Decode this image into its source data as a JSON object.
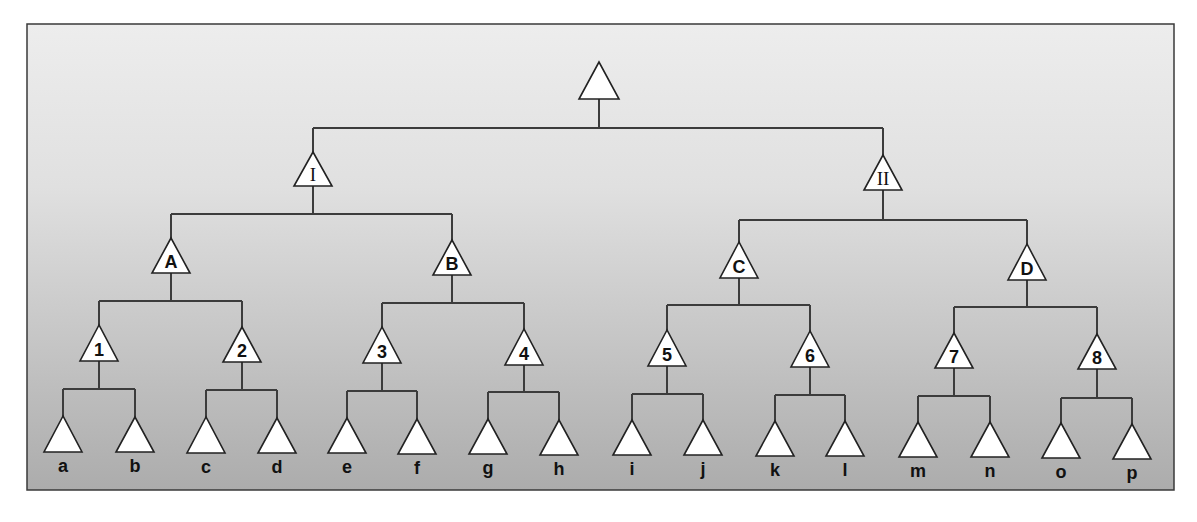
{
  "diagram": {
    "type": "tree-diagram",
    "colors": {
      "background_top": "#ededed",
      "background_bottom": "#acacac",
      "frame": "#3a3a3a",
      "lines": "#3c3c3c",
      "node_fill": "#ffffff"
    },
    "frame": {
      "x": 27,
      "y": 24,
      "w": 1147,
      "h": 466
    },
    "nodes": [
      {
        "id": "root",
        "label": "",
        "cx": 599,
        "apex": 62,
        "base": 99,
        "hw": 20,
        "style": "none",
        "children": [
          "I",
          "II"
        ],
        "bar_y": 128
      },
      {
        "id": "I",
        "label": "I",
        "cx": 313,
        "apex": 152,
        "base": 186,
        "hw": 19,
        "style": "serif",
        "children": [
          "A",
          "B"
        ],
        "bar_y": 214
      },
      {
        "id": "II",
        "label": "II",
        "cx": 883,
        "apex": 155,
        "base": 190,
        "hw": 19,
        "style": "serif",
        "children": [
          "C",
          "D"
        ],
        "bar_y": 220
      },
      {
        "id": "A",
        "label": "A",
        "cx": 171,
        "apex": 238,
        "base": 273,
        "hw": 19,
        "style": "sans",
        "children": [
          "1",
          "2"
        ],
        "bar_y": 301
      },
      {
        "id": "B",
        "label": "B",
        "cx": 452,
        "apex": 240,
        "base": 275,
        "hw": 19,
        "style": "sans",
        "children": [
          "3",
          "4"
        ],
        "bar_y": 303
      },
      {
        "id": "C",
        "label": "C",
        "cx": 739,
        "apex": 242,
        "base": 278,
        "hw": 19,
        "style": "sans",
        "children": [
          "5",
          "6"
        ],
        "bar_y": 305
      },
      {
        "id": "D",
        "label": "D",
        "cx": 1027,
        "apex": 244,
        "base": 280,
        "hw": 19,
        "style": "sans",
        "children": [
          "7",
          "8"
        ],
        "bar_y": 307
      },
      {
        "id": "1",
        "label": "1",
        "cx": 99,
        "apex": 325,
        "base": 361,
        "hw": 19,
        "style": "sans",
        "children": [
          "a",
          "b"
        ],
        "bar_y": 389
      },
      {
        "id": "2",
        "label": "2",
        "cx": 242,
        "apex": 327,
        "base": 362,
        "hw": 19,
        "style": "sans",
        "children": [
          "c",
          "d"
        ],
        "bar_y": 390
      },
      {
        "id": "3",
        "label": "3",
        "cx": 382,
        "apex": 327,
        "base": 363,
        "hw": 19,
        "style": "sans",
        "children": [
          "e",
          "f"
        ],
        "bar_y": 391
      },
      {
        "id": "4",
        "label": "4",
        "cx": 524,
        "apex": 329,
        "base": 365,
        "hw": 19,
        "style": "sans",
        "children": [
          "g",
          "h"
        ],
        "bar_y": 392
      },
      {
        "id": "5",
        "label": "5",
        "cx": 667,
        "apex": 330,
        "base": 366,
        "hw": 19,
        "style": "sans",
        "children": [
          "i",
          "j"
        ],
        "bar_y": 394
      },
      {
        "id": "6",
        "label": "6",
        "cx": 810,
        "apex": 331,
        "base": 367,
        "hw": 19,
        "style": "sans",
        "children": [
          "k",
          "l"
        ],
        "bar_y": 395
      },
      {
        "id": "7",
        "label": "7",
        "cx": 954,
        "apex": 333,
        "base": 368,
        "hw": 19,
        "style": "sans",
        "children": [
          "m",
          "n"
        ],
        "bar_y": 396
      },
      {
        "id": "8",
        "label": "8",
        "cx": 1097,
        "apex": 334,
        "base": 369,
        "hw": 19,
        "style": "sans",
        "children": [
          "o",
          "p"
        ],
        "bar_y": 398
      },
      {
        "id": "a",
        "label": "a",
        "cx": 63,
        "apex": 416,
        "base": 452,
        "hw": 19,
        "style": "leaf"
      },
      {
        "id": "b",
        "label": "b",
        "cx": 135,
        "apex": 417,
        "base": 452,
        "hw": 19,
        "style": "leaf"
      },
      {
        "id": "c",
        "label": "c",
        "cx": 206,
        "apex": 417,
        "base": 453,
        "hw": 19,
        "style": "leaf"
      },
      {
        "id": "d",
        "label": "d",
        "cx": 277,
        "apex": 418,
        "base": 453,
        "hw": 19,
        "style": "leaf"
      },
      {
        "id": "e",
        "label": "e",
        "cx": 347,
        "apex": 418,
        "base": 453,
        "hw": 19,
        "style": "leaf"
      },
      {
        "id": "f",
        "label": "f",
        "cx": 417,
        "apex": 419,
        "base": 454,
        "hw": 19,
        "style": "leaf"
      },
      {
        "id": "g",
        "label": "g",
        "cx": 488,
        "apex": 419,
        "base": 454,
        "hw": 19,
        "style": "leaf"
      },
      {
        "id": "h",
        "label": "h",
        "cx": 559,
        "apex": 420,
        "base": 455,
        "hw": 19,
        "style": "leaf"
      },
      {
        "id": "i",
        "label": "i",
        "cx": 632,
        "apex": 420,
        "base": 455,
        "hw": 19,
        "style": "leaf"
      },
      {
        "id": "j",
        "label": "j",
        "cx": 703,
        "apex": 420,
        "base": 455,
        "hw": 19,
        "style": "leaf"
      },
      {
        "id": "k",
        "label": "k",
        "cx": 775,
        "apex": 421,
        "base": 456,
        "hw": 19,
        "style": "leaf"
      },
      {
        "id": "l",
        "label": "l",
        "cx": 845,
        "apex": 421,
        "base": 456,
        "hw": 19,
        "style": "leaf"
      },
      {
        "id": "m",
        "label": "m",
        "cx": 918,
        "apex": 422,
        "base": 457,
        "hw": 19,
        "style": "leaf"
      },
      {
        "id": "n",
        "label": "n",
        "cx": 990,
        "apex": 422,
        "base": 457,
        "hw": 19,
        "style": "leaf"
      },
      {
        "id": "o",
        "label": "o",
        "cx": 1061,
        "apex": 423,
        "base": 458,
        "hw": 19,
        "style": "leaf"
      },
      {
        "id": "p",
        "label": "p",
        "cx": 1132,
        "apex": 424,
        "base": 459,
        "hw": 19,
        "style": "leaf"
      }
    ],
    "levels": {
      "root": [
        ""
      ],
      "level_1_roman": [
        "I",
        "II"
      ],
      "level_2_letters": [
        "A",
        "B",
        "C",
        "D"
      ],
      "level_3_numbers": [
        "1",
        "2",
        "3",
        "4",
        "5",
        "6",
        "7",
        "8"
      ],
      "leaves": [
        "a",
        "b",
        "c",
        "d",
        "e",
        "f",
        "g",
        "h",
        "i",
        "j",
        "k",
        "l",
        "m",
        "n",
        "o",
        "p"
      ]
    }
  }
}
